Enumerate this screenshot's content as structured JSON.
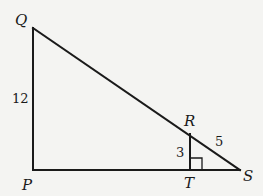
{
  "diagram": {
    "type": "geometry",
    "points": {
      "Q": {
        "label": "Q",
        "x": 33,
        "y": 28
      },
      "P": {
        "label": "P",
        "x": 33,
        "y": 170
      },
      "S": {
        "label": "S",
        "x": 240,
        "y": 170
      },
      "T": {
        "label": "T",
        "x": 190,
        "y": 170
      },
      "R": {
        "label": "R",
        "x": 190,
        "y": 134
      }
    },
    "segments": [
      {
        "from": "Q",
        "to": "P"
      },
      {
        "from": "P",
        "to": "S"
      },
      {
        "from": "Q",
        "to": "S"
      },
      {
        "from": "R",
        "to": "T"
      }
    ],
    "lengths": {
      "QP": "12",
      "RT": "3",
      "RS": "5"
    },
    "right_angle_marker": "T"
  }
}
